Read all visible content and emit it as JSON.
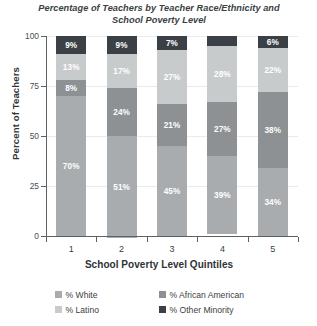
{
  "chart_data": {
    "type": "bar",
    "subtype": "stacked-bar-100",
    "title": "Percentage of Teachers by Teacher Race/Ethnicity and School Poverty Level",
    "title_line1": "Percentage of Teachers by Teacher Race/Ethnicity and",
    "title_line2": "School Poverty Level",
    "xlabel": "School Poverty Level Quintiles",
    "ylabel": "Percent of Teachers",
    "categories": [
      "1",
      "2",
      "3",
      "4",
      "5"
    ],
    "ylim": [
      0,
      100
    ],
    "yticks": [
      0,
      25,
      50,
      75,
      100
    ],
    "ytick_labels": [
      "0",
      "25",
      "50",
      "75",
      "100"
    ],
    "grid": true,
    "grid_axis": "y",
    "legend_position": "bottom",
    "stack_order_bottom_to_top": [
      "% White",
      "% African American",
      "% Latino",
      "% Other Minority"
    ],
    "series": [
      {
        "name": "% White",
        "color": "#a8acae",
        "values": [
          70,
          51,
          45,
          39,
          34
        ],
        "labels": [
          "70%",
          "51%",
          "45%",
          "39%",
          "34%"
        ]
      },
      {
        "name": "% African American",
        "color": "#8d9193",
        "values": [
          8,
          24,
          21,
          27,
          38
        ],
        "labels": [
          "8%",
          "24%",
          "21%",
          "27%",
          "38%"
        ]
      },
      {
        "name": "% Latino",
        "color": "#c8cbcc",
        "values": [
          13,
          17,
          27,
          28,
          22
        ],
        "labels": [
          "13%",
          "17%",
          "27%",
          "28%",
          "22%"
        ]
      },
      {
        "name": "% Other Minority",
        "color": "#3a4045",
        "values": [
          9,
          9,
          7,
          5,
          6
        ],
        "labels": [
          "9%",
          "9%",
          "7%",
          "5%",
          "6%"
        ]
      }
    ]
  },
  "legend": {
    "items": [
      {
        "label": "% White",
        "color": "#a8acae"
      },
      {
        "label": "% African American",
        "color": "#8d9193"
      },
      {
        "label": "% Latino",
        "color": "#c8cbcc"
      },
      {
        "label": "% Other Minority",
        "color": "#3a4045"
      }
    ]
  },
  "colors": {
    "white_series": "#a8acae",
    "african_american_series": "#8d9193",
    "latino_series": "#c8cbcc",
    "other_minority_series": "#3a4045",
    "axis": "#5d6164",
    "gridline": "#e9eaea",
    "text": "#3b3f42",
    "background": "#ffffff"
  }
}
